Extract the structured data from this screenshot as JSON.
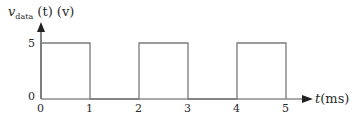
{
  "chart_data": {
    "type": "line",
    "title": "",
    "ylabel": "v_data (t) (v)",
    "ylabel_parts": {
      "var": "v",
      "subscript": "data",
      "rest": " (t) (v)"
    },
    "xlabel": "t(ms)",
    "xlabel_parts": {
      "var": "t",
      "unit": "(ms)"
    },
    "x_ticks": [
      "0",
      "1",
      "2",
      "3",
      "4",
      "5"
    ],
    "y_ticks": [
      "0",
      "5"
    ],
    "xlim": [
      0,
      5.5
    ],
    "ylim": [
      0,
      6
    ],
    "grid": false,
    "legend": null,
    "series": [
      {
        "name": "v_data(t)",
        "step": true,
        "x": [
          0,
          0,
          1,
          1,
          2,
          2,
          3,
          3,
          4,
          4,
          5,
          5
        ],
        "y": [
          0,
          5,
          5,
          0,
          0,
          5,
          5,
          0,
          0,
          5,
          5,
          0
        ]
      }
    ]
  },
  "colors": {
    "line": "#7a7a7a",
    "axis": "#333333",
    "text": "#2a2a2a"
  }
}
